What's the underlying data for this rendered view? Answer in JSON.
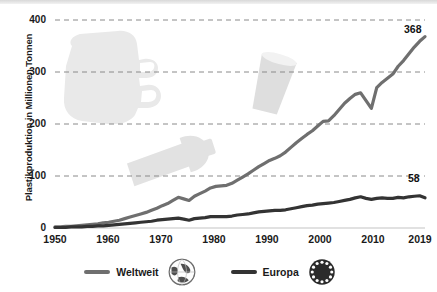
{
  "chart_data": {
    "type": "line",
    "title": "",
    "xlabel": "",
    "ylabel": "Plastikproduktion in Millionen Tonnen",
    "xlim": [
      1950,
      2019
    ],
    "ylim": [
      0,
      400
    ],
    "grid": "horizontal-dashed",
    "legend_position": "bottom-center",
    "y_ticks": [
      0,
      100,
      200,
      300,
      400
    ],
    "y_tick_labels": [
      "0",
      "100",
      "200",
      "300",
      "400"
    ],
    "x_ticks": [
      1950,
      1960,
      1970,
      1980,
      1990,
      2000,
      2010,
      2019
    ],
    "x_tick_labels": [
      "1950",
      "1960",
      "1970",
      "1980",
      "1990",
      "2000",
      "2010",
      "2019"
    ],
    "x": [
      1950,
      1951,
      1952,
      1953,
      1954,
      1955,
      1956,
      1957,
      1958,
      1959,
      1960,
      1961,
      1962,
      1963,
      1964,
      1965,
      1966,
      1967,
      1968,
      1969,
      1970,
      1971,
      1972,
      1973,
      1974,
      1975,
      1976,
      1977,
      1978,
      1979,
      1980,
      1981,
      1982,
      1983,
      1984,
      1985,
      1986,
      1987,
      1988,
      1989,
      1990,
      1991,
      1992,
      1993,
      1994,
      1995,
      1996,
      1997,
      1998,
      1999,
      2000,
      2001,
      2002,
      2003,
      2004,
      2005,
      2006,
      2007,
      2008,
      2009,
      2010,
      2011,
      2012,
      2013,
      2014,
      2015,
      2016,
      2017,
      2018,
      2019
    ],
    "series": [
      {
        "name": "Weltweit",
        "color": "#6f6f6f",
        "end_value": 368,
        "end_label": "368",
        "values": [
          2,
          2,
          3,
          3,
          4,
          5,
          6,
          7,
          8,
          10,
          11,
          13,
          15,
          18,
          21,
          24,
          27,
          30,
          34,
          38,
          43,
          47,
          53,
          59,
          56,
          53,
          61,
          66,
          71,
          77,
          80,
          81,
          82,
          86,
          92,
          98,
          104,
          111,
          118,
          124,
          130,
          134,
          139,
          146,
          155,
          164,
          172,
          180,
          187,
          196,
          205,
          206,
          216,
          228,
          240,
          249,
          257,
          260,
          245,
          230,
          270,
          280,
          288,
          296,
          311,
          322,
          335,
          348,
          359,
          368
        ]
      },
      {
        "name": "Europa",
        "color": "#333333",
        "end_value": 58,
        "end_label": "58",
        "values": [
          1,
          1,
          1,
          2,
          2,
          2,
          3,
          3,
          4,
          4,
          5,
          6,
          7,
          8,
          9,
          10,
          11,
          12,
          13,
          15,
          16,
          17,
          18,
          19,
          17,
          15,
          18,
          19,
          20,
          22,
          22,
          22,
          22,
          23,
          25,
          26,
          27,
          29,
          31,
          32,
          33,
          34,
          34,
          35,
          37,
          39,
          41,
          43,
          44,
          46,
          47,
          48,
          49,
          51,
          53,
          55,
          58,
          60,
          57,
          55,
          57,
          58,
          57,
          57,
          59,
          58,
          60,
          61,
          62,
          58
        ]
      }
    ],
    "annotations": [
      {
        "name": "weltweit-end-value",
        "text": "368",
        "series": "Weltweit",
        "x": 2019,
        "y": 368
      },
      {
        "name": "europa-end-value",
        "text": "58",
        "series": "Europa",
        "x": 2019,
        "y": 58
      }
    ]
  },
  "legend": {
    "items": [
      {
        "label": "Weltweit",
        "color": "#6f6f6f",
        "icon": "globe-icon"
      },
      {
        "label": "Europa",
        "color": "#333333",
        "icon": "eu-stars-icon"
      }
    ]
  },
  "decorations": [
    {
      "name": "plastic-bag-silhouette",
      "color": "#e9e9e9"
    },
    {
      "name": "plastic-bottle-silhouette",
      "color": "#e2e2e2"
    },
    {
      "name": "plastic-cup-silhouette",
      "color": "#dedede"
    }
  ],
  "colors": {
    "background": "#ffffff",
    "gridline": "#8a8a8a",
    "axis": "#d7d7d7",
    "text": "#1a1a1a",
    "weltweit": "#6f6f6f",
    "europa": "#333333",
    "decoration": "#e6e6e6"
  }
}
